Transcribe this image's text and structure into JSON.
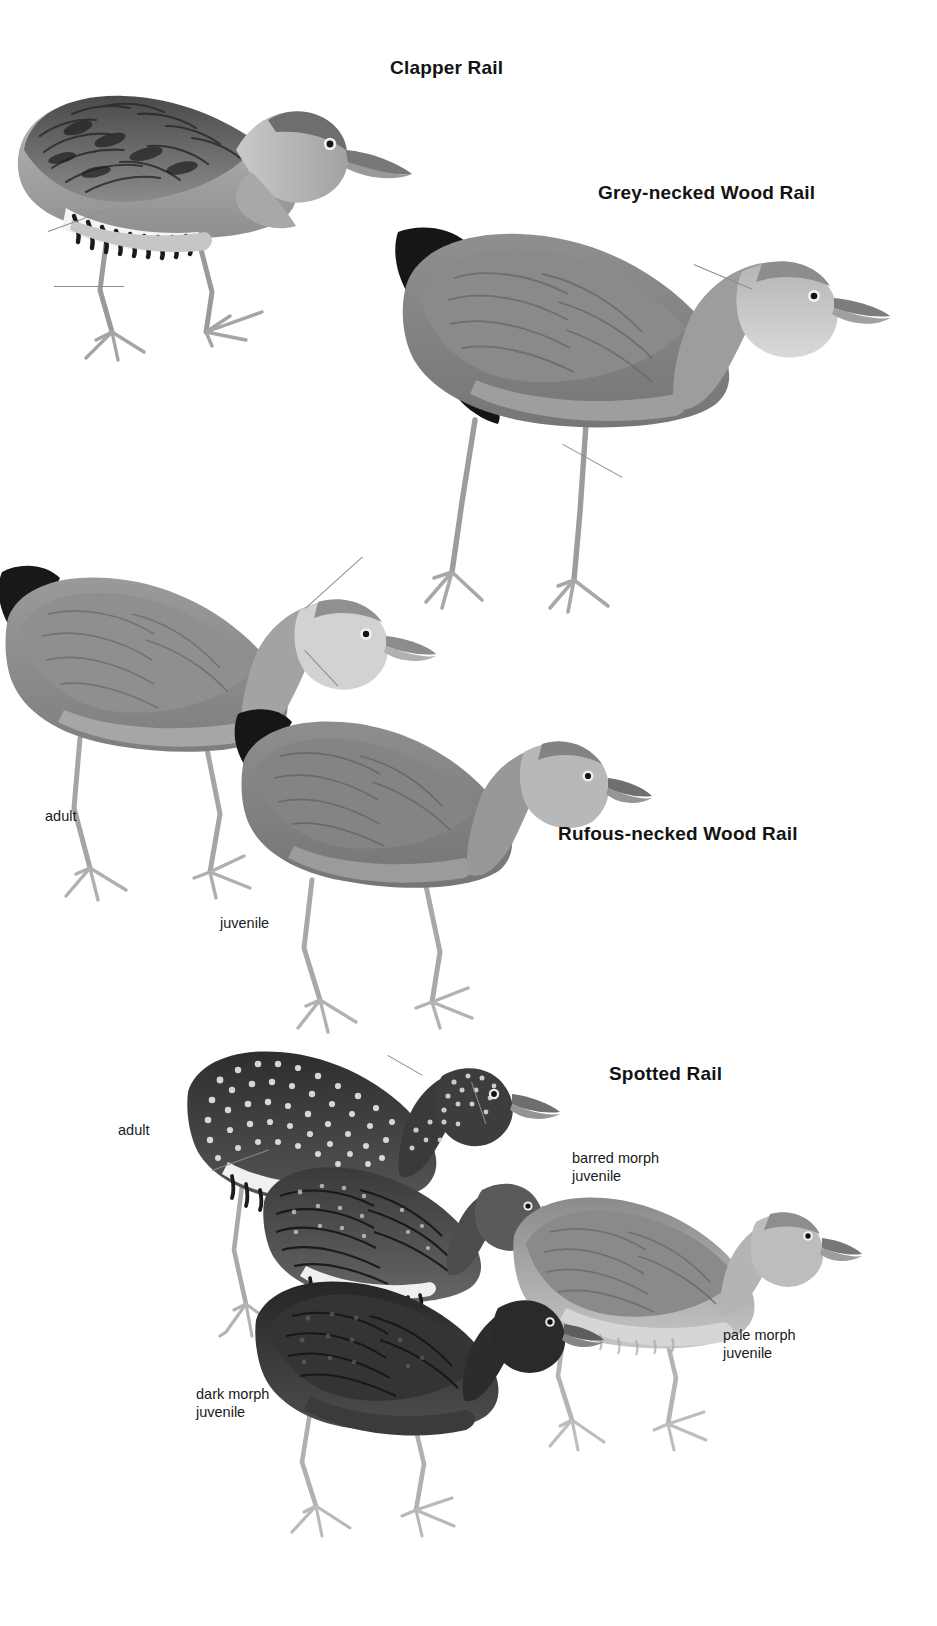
{
  "plate": {
    "title": "Rails plate",
    "background_color": "#ffffff",
    "ink_color": "#131313",
    "leader_color": "#8c8c8c"
  },
  "species": [
    {
      "id": "clapper-rail",
      "label": "Clapper Rail",
      "x": 390,
      "y": 57,
      "figures": [
        {
          "id": "clapper-adult",
          "caption": "",
          "x": 5,
          "y": 45,
          "w": 420,
          "h": 300
        }
      ]
    },
    {
      "id": "grey-necked-wood-rail",
      "label": "Grey-necked Wood Rail",
      "x": 598,
      "y": 182,
      "figures": [
        {
          "id": "grey-necked-adult",
          "caption": "",
          "x": 395,
          "y": 215,
          "w": 470,
          "h": 410
        }
      ]
    },
    {
      "id": "rufous-necked-wood-rail",
      "label": "Rufous-necked Wood Rail",
      "x": 558,
      "y": 823,
      "figures": [
        {
          "id": "rufous-adult",
          "caption": "adult",
          "x": 0,
          "y": 560,
          "w": 400,
          "h": 340
        },
        {
          "id": "rufous-juvenile",
          "caption": "juvenile",
          "x": 205,
          "y": 700,
          "w": 420,
          "h": 320
        }
      ]
    },
    {
      "id": "spotted-rail",
      "label": "Spotted Rail",
      "x": 609,
      "y": 1063,
      "figures": [
        {
          "id": "spotted-adult",
          "caption": "adult",
          "x": 180,
          "y": 1040,
          "w": 330,
          "h": 340
        },
        {
          "id": "spotted-barred-juv",
          "caption": "barred morph\njuvenile",
          "x": 255,
          "y": 1150,
          "w": 270,
          "h": 250
        },
        {
          "id": "spotted-pale-juv",
          "caption": "pale morph\njuvenile",
          "x": 505,
          "y": 1185,
          "w": 310,
          "h": 270
        },
        {
          "id": "spotted-dark-juv",
          "caption": "dark morph\njuvenile",
          "x": 245,
          "y": 1265,
          "w": 310,
          "h": 270
        }
      ]
    }
  ],
  "annotations": [
    {
      "id": "ann-rufous-adult",
      "text": "adult",
      "x": 45,
      "y": 808
    },
    {
      "id": "ann-rufous-juvenile",
      "text": "juvenile",
      "x": 220,
      "y": 915
    },
    {
      "id": "ann-spotted-adult",
      "text": "adult",
      "x": 118,
      "y": 1122
    },
    {
      "id": "ann-spotted-barred",
      "text": "barred morph\njuvenile",
      "x": 572,
      "y": 1150
    },
    {
      "id": "ann-spotted-pale",
      "text": "pale morph\njuvenile",
      "x": 723,
      "y": 1327
    },
    {
      "id": "ann-spotted-dark",
      "text": "dark morph\njuvenile",
      "x": 196,
      "y": 1386
    }
  ],
  "leaders": [
    {
      "id": "leader-clapper-flank",
      "x1": 48,
      "y1": 231,
      "x2": 110,
      "y2": 208
    },
    {
      "id": "leader-clapper-leg",
      "x1": 54,
      "y1": 286,
      "x2": 124,
      "y2": 286
    },
    {
      "id": "leader-greyneck-nape",
      "x1": 694,
      "y1": 264,
      "x2": 752,
      "y2": 288
    },
    {
      "id": "leader-greyneck-leg",
      "x1": 563,
      "y1": 444,
      "x2": 622,
      "y2": 477
    },
    {
      "id": "leader-rufous-crown",
      "x1": 305,
      "y1": 608,
      "x2": 362,
      "y2": 556
    },
    {
      "id": "leader-rufous-breast",
      "x1": 338,
      "y1": 686,
      "x2": 305,
      "y2": 650
    },
    {
      "id": "leader-spotted-back",
      "x1": 388,
      "y1": 1055,
      "x2": 420,
      "y2": 1078
    },
    {
      "id": "leader-spotted-bill",
      "x1": 486,
      "y1": 1123,
      "x2": 472,
      "y2": 1082
    },
    {
      "id": "leader-spotted-flank",
      "x1": 212,
      "y1": 1170,
      "x2": 268,
      "y2": 1150
    }
  ]
}
